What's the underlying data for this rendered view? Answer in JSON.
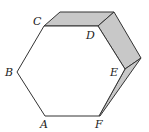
{
  "diagram": {
    "title": "",
    "shape": "hexagon with folded/extruded edges",
    "labels": {
      "A": "A",
      "B": "B",
      "C": "C",
      "D": "D",
      "E": "E",
      "F": "F"
    },
    "colors": {
      "stroke": "#333333",
      "shade": "#c8c8c8",
      "background": "#ffffff"
    }
  }
}
